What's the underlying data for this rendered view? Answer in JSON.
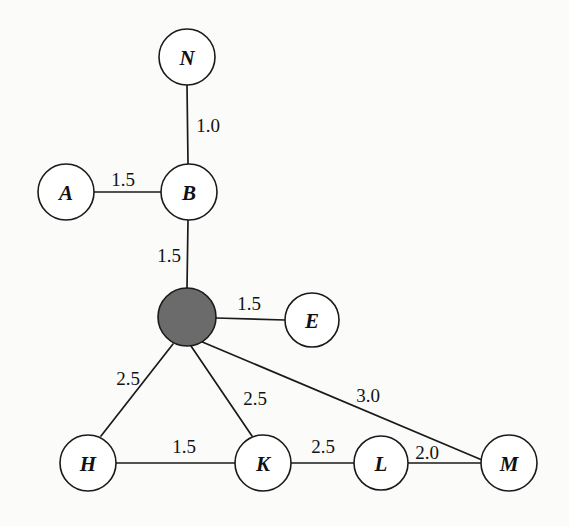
{
  "diagram": {
    "background_color": "#fbfbfa",
    "stroke_color": "#1a1a1a",
    "highlight_fill": "#6b6b6b",
    "node_fill": "#ffffff",
    "width": 569,
    "height": 526
  },
  "nodes": [
    {
      "id": "N",
      "label": "N",
      "cx": 187,
      "cy": 57,
      "r": 28,
      "filled": false
    },
    {
      "id": "A",
      "label": "A",
      "cx": 66,
      "cy": 192,
      "r": 28,
      "filled": false
    },
    {
      "id": "B",
      "label": "B",
      "cx": 189,
      "cy": 192,
      "r": 28,
      "filled": false
    },
    {
      "id": "S",
      "label": "",
      "cx": 187,
      "cy": 317,
      "r": 29,
      "filled": true
    },
    {
      "id": "E",
      "label": "E",
      "cx": 312,
      "cy": 320,
      "r": 27,
      "filled": false
    },
    {
      "id": "H",
      "label": "H",
      "cx": 88,
      "cy": 463,
      "r": 28,
      "filled": false
    },
    {
      "id": "K",
      "label": "K",
      "cx": 263,
      "cy": 463,
      "r": 28,
      "filled": false
    },
    {
      "id": "L",
      "label": "L",
      "cx": 381,
      "cy": 463,
      "r": 27,
      "filled": false
    },
    {
      "id": "M",
      "label": "M",
      "cx": 509,
      "cy": 463,
      "r": 28,
      "filled": false
    }
  ],
  "edges": [
    {
      "from": "N",
      "to": "B",
      "weight": "1.0",
      "x1": 187,
      "y1": 85,
      "x2": 188,
      "y2": 164,
      "label_x": 208,
      "label_y": 125
    },
    {
      "from": "A",
      "to": "B",
      "weight": "1.5",
      "x1": 94,
      "y1": 192,
      "x2": 161,
      "y2": 192,
      "label_x": 123,
      "label_y": 179
    },
    {
      "from": "B",
      "to": "S",
      "weight": "1.5",
      "x1": 188,
      "y1": 220,
      "x2": 187,
      "y2": 288,
      "label_x": 169,
      "label_y": 255
    },
    {
      "from": "S",
      "to": "E",
      "weight": "1.5",
      "x1": 216,
      "y1": 318,
      "x2": 285,
      "y2": 320,
      "label_x": 249,
      "label_y": 303
    },
    {
      "from": "S",
      "to": "H",
      "weight": "2.5",
      "x1": 173,
      "y1": 344,
      "x2": 101,
      "y2": 436,
      "label_x": 128,
      "label_y": 378
    },
    {
      "from": "S",
      "to": "K",
      "weight": "2.5",
      "x1": 191,
      "y1": 346,
      "x2": 252,
      "y2": 436,
      "label_x": 255,
      "label_y": 398
    },
    {
      "from": "S",
      "to": "M",
      "weight": "3.0",
      "x1": 200,
      "y1": 341,
      "x2": 482,
      "y2": 460,
      "label_x": 368,
      "label_y": 395
    },
    {
      "from": "H",
      "to": "K",
      "weight": "1.5",
      "x1": 116,
      "y1": 463,
      "x2": 235,
      "y2": 463,
      "label_x": 184,
      "label_y": 446
    },
    {
      "from": "K",
      "to": "L",
      "weight": "2.5",
      "x1": 291,
      "y1": 463,
      "x2": 354,
      "y2": 463,
      "label_x": 323,
      "label_y": 446
    },
    {
      "from": "L",
      "to": "M",
      "weight": "2.0",
      "x1": 408,
      "y1": 463,
      "x2": 481,
      "y2": 463,
      "label_x": 427,
      "label_y": 452
    }
  ]
}
